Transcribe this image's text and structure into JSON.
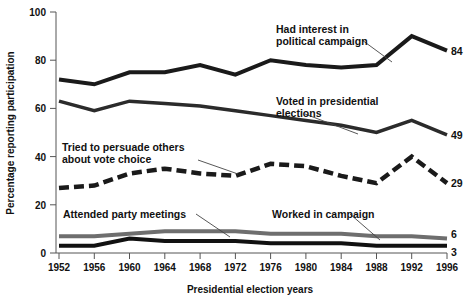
{
  "chart_data": {
    "type": "line",
    "title": "",
    "xlabel": "Presidential election years",
    "ylabel": "Percentage reporting participation",
    "categories": [
      "1952",
      "1956",
      "1960",
      "1964",
      "1968",
      "1972",
      "1976",
      "1980",
      "1984",
      "1988",
      "1992",
      "1996"
    ],
    "xlim": [
      1952,
      1996
    ],
    "ylim": [
      0,
      100
    ],
    "yticks": [
      0,
      20,
      40,
      60,
      80,
      100
    ],
    "ytick_labels": [
      "0",
      "20",
      "40",
      "60",
      "80",
      "100"
    ],
    "grid": false,
    "legend": "inline-annotations",
    "series": [
      {
        "name": "Had interest in political campaign",
        "style": "solid",
        "color": "#1a1a1a",
        "width": 4,
        "end_value": 84,
        "values": [
          72,
          70,
          75,
          75,
          78,
          74,
          80,
          78,
          77,
          78,
          90,
          84
        ]
      },
      {
        "name": "Voted in presidential elections",
        "style": "solid",
        "color": "#2b2b2b",
        "width": 3.5,
        "end_value": 49,
        "values": [
          63,
          59,
          63,
          62,
          61,
          59,
          57,
          55,
          53,
          50,
          55,
          49
        ]
      },
      {
        "name": "Tried to persuade others about vote choice",
        "style": "dashed",
        "color": "#1a1a1a",
        "width": 4.5,
        "end_value": 29,
        "values": [
          27,
          28,
          33,
          35,
          33,
          32,
          37,
          36,
          32,
          29,
          40,
          29
        ]
      },
      {
        "name": "Attended party meetings",
        "style": "solid",
        "color": "#6e6e6e",
        "width": 4,
        "end_value": 6,
        "values": [
          7,
          7,
          8,
          9,
          9,
          9,
          8,
          8,
          8,
          7,
          7,
          6
        ]
      },
      {
        "name": "Worked in campaign",
        "style": "solid",
        "color": "#111111",
        "width": 4,
        "end_value": 3,
        "values": [
          3,
          3,
          6,
          5,
          5,
          5,
          4,
          4,
          4,
          3,
          3,
          3
        ]
      }
    ],
    "annotations": [
      {
        "text_line1": "Had interest in",
        "text_line2": "political campaign"
      },
      {
        "text_line1": "Voted in presidential",
        "text_line2": "elections"
      },
      {
        "text_line1": "Tried to persuade others",
        "text_line2": "about vote choice"
      },
      {
        "text_line1": "Attended party meetings",
        "text_line2": ""
      },
      {
        "text_line1": "Worked in campaign",
        "text_line2": ""
      }
    ]
  }
}
